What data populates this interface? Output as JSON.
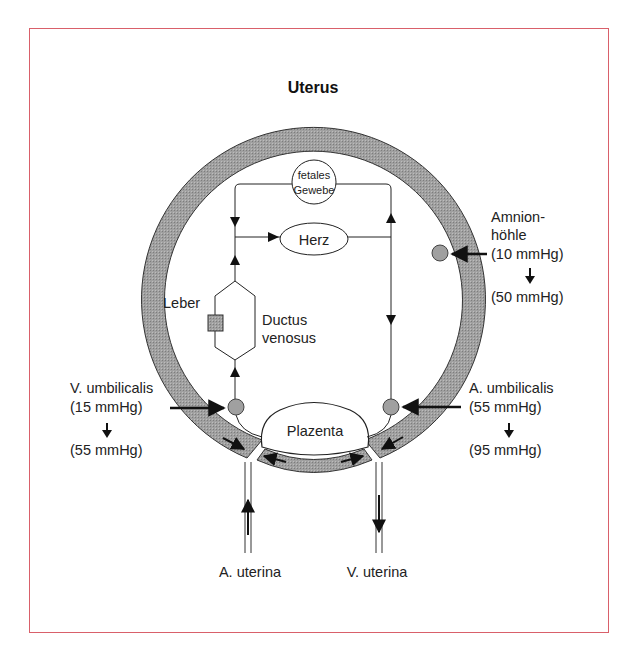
{
  "diagram": {
    "title": "Uterus",
    "frame_color": "#d9606a",
    "ring_color": "#9a9a9a",
    "nodes": {
      "fetal_tissue": {
        "line1": "fetales",
        "line2": "Gewebe"
      },
      "heart": "Herz",
      "liver": "Leber",
      "ductus": {
        "line1": "Ductus",
        "line2": "venosus"
      },
      "placenta": "Plazenta"
    },
    "labels": {
      "amnion": {
        "line1": "Amnion-",
        "line2": "höhle",
        "pressure_from": "(10 mmHg)",
        "pressure_to": "(50 mmHg)"
      },
      "v_umbilicalis": {
        "name": "V. umbilicalis",
        "pressure_from": "(15 mmHg)",
        "pressure_to": "(55 mmHg)"
      },
      "a_umbilicalis": {
        "name": "A. umbilicalis",
        "pressure_from": "(55 mmHg)",
        "pressure_to": "(95 mmHg)"
      },
      "a_uterina": "A. uterina",
      "v_uterina": "V. uterina"
    }
  }
}
